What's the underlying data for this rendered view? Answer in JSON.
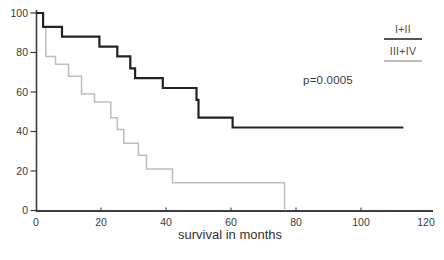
{
  "chart_data": {
    "type": "line",
    "subtype": "kaplan-meier-step",
    "title": "",
    "xlabel": "survival in months",
    "ylabel": "",
    "xlim": [
      0,
      120
    ],
    "ylim": [
      0,
      100
    ],
    "grid": false,
    "x_ticks": [
      0,
      20,
      40,
      60,
      80,
      100,
      120
    ],
    "y_ticks": [
      0,
      20,
      40,
      60,
      80,
      100
    ],
    "annotation": "p=0.0005",
    "legend_position": "top-right",
    "series": [
      {
        "name": "I+II",
        "color": "#222222",
        "stroke_width": 2.2,
        "step_points": [
          [
            0,
            100
          ],
          [
            2.2,
            93
          ],
          [
            8,
            88
          ],
          [
            19.5,
            83
          ],
          [
            25,
            78
          ],
          [
            29,
            72
          ],
          [
            30.5,
            67
          ],
          [
            39,
            62
          ],
          [
            49.4,
            56
          ],
          [
            50,
            47
          ],
          [
            60.5,
            42
          ]
        ],
        "end_month": 113
      },
      {
        "name": "III+IV",
        "color": "#bdbdbd",
        "stroke_width": 1.5,
        "step_points": [
          [
            0,
            100
          ],
          [
            2.2,
            93
          ],
          [
            3,
            78
          ],
          [
            6,
            74
          ],
          [
            10,
            68
          ],
          [
            14,
            59
          ],
          [
            18,
            55
          ],
          [
            23,
            47
          ],
          [
            25,
            41
          ],
          [
            27,
            34
          ],
          [
            31.5,
            28
          ],
          [
            34,
            21
          ],
          [
            42,
            14
          ],
          [
            76.5,
            0
          ]
        ],
        "end_month": 76.5
      }
    ]
  },
  "labels": {
    "p_value": "p=0.0005",
    "x_axis_title": "survival in months",
    "legend_1": "I+II",
    "legend_2": "III+IV"
  },
  "colors": {
    "axis": "#3c3c3c",
    "tick_text": "#3a3a3a",
    "background": "#ffffff",
    "series_1": "#222222",
    "series_2": "#bdbdbd"
  }
}
